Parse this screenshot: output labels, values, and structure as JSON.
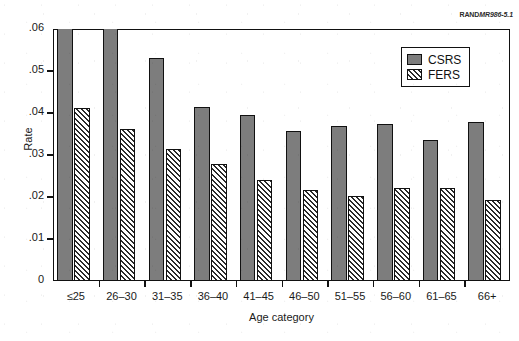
{
  "source_credit": {
    "rand": "RAND",
    "report_id": "MR986-5.1"
  },
  "chart_data": {
    "type": "bar",
    "title": "",
    "xlabel": "Age category",
    "ylabel": "Rate",
    "categories": [
      "≤25",
      "26–30",
      "31–35",
      "36–40",
      "41–45",
      "46–50",
      "51–55",
      "56–60",
      "61–65",
      "66+"
    ],
    "series": [
      {
        "name": "CSRS",
        "color": "#7d7d7d",
        "fill": "solid",
        "values": [
          0.06,
          0.06,
          0.053,
          0.0415,
          0.0395,
          0.0357,
          0.0368,
          0.0375,
          0.0335,
          0.0378
        ],
        "clipped": [
          true,
          true,
          false,
          false,
          false,
          false,
          false,
          false,
          false,
          false
        ]
      },
      {
        "name": "FERS",
        "color": "#ffffff",
        "fill": "diagonal-hatch",
        "values": [
          0.0413,
          0.0362,
          0.0315,
          0.0278,
          0.0241,
          0.0217,
          0.0203,
          0.0222,
          0.0222,
          0.0192
        ],
        "clipped": [
          false,
          false,
          false,
          false,
          false,
          false,
          false,
          false,
          false,
          false
        ]
      }
    ],
    "ylim": [
      0,
      0.06
    ],
    "yticks": [
      0,
      0.01,
      0.02,
      0.03,
      0.04,
      0.05,
      0.06
    ],
    "ytick_labels": [
      "0",
      ".01",
      ".02",
      ".03",
      ".04",
      ".05",
      ".06"
    ],
    "grid": false,
    "legend_position": "top-right",
    "legend_entries": [
      "CSRS",
      "FERS"
    ],
    "note": "First two CSRS bars reach/exceed the .06 axis maximum and are clipped at the plot ceiling."
  }
}
